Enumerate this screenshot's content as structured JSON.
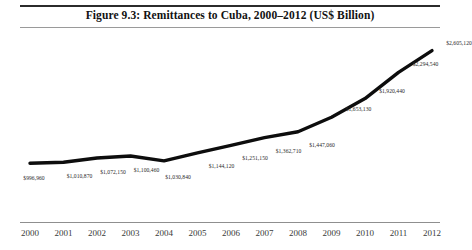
{
  "figure": {
    "title": "Figure 9.3: Remittances to Cuba, 2000–2012 (US$ Billion)"
  },
  "colors": {
    "line": "#0d0d0d",
    "rule_top": "#2b2b2b",
    "rule_thin": "#9a9a9a",
    "axis_rule": "#8f8f8f",
    "label_text": "#2a2a2a",
    "background": "#ffffff"
  },
  "chart_data": {
    "type": "line",
    "title": "Figure 9.3: Remittances to Cuba, 2000–2012 (US$ Billion)",
    "xlabel": "",
    "ylabel": "",
    "grid": false,
    "legend": false,
    "axis_visible": {
      "x": true,
      "y": false
    },
    "categories": [
      "2000",
      "2001",
      "2002",
      "2003",
      "2004",
      "2005",
      "2006",
      "2007",
      "2008",
      "2009",
      "2010",
      "2011",
      "2012"
    ],
    "values": [
      996960,
      1010870,
      1072150,
      1100460,
      1030840,
      1144120,
      1251150,
      1362710,
      1447060,
      1653130,
      1920440,
      2294540,
      2605120
    ],
    "point_labels": [
      "$996,960",
      "$1,010,870",
      "$1,072,150",
      "$1,100,460",
      "$1,030,840",
      "$1,144,120",
      "$1,251,150",
      "$1,362,710",
      "$1,447,060",
      "$1,653,130",
      "$1,920,440",
      "$2,294,540",
      "$2,605,120"
    ],
    "ylim": [
      900000,
      2700000
    ],
    "xlim": [
      "2000",
      "2012"
    ]
  }
}
